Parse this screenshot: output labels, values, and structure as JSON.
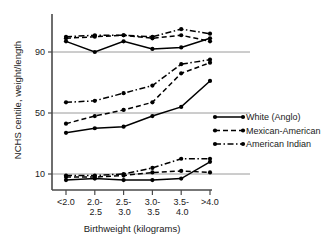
{
  "chart_data": {
    "type": "line",
    "title": "",
    "xlabel": "Birthweight  (kilograms)",
    "ylabel": "NCHS centile, weight/length",
    "categories": [
      "<2.0",
      "2.0-\n2.5",
      "2.5-\n3.0",
      "3.0-\n3.5",
      "3.5-\n4.0",
      ">4.0"
    ],
    "category_lines": [
      [
        "<2.0",
        ""
      ],
      [
        "2.0-",
        "2.5"
      ],
      [
        "2.5-",
        "3.0"
      ],
      [
        "3.0-",
        "3.5"
      ],
      [
        "3.5-",
        "4.0"
      ],
      [
        ">4.0",
        ""
      ]
    ],
    "yticks": [
      90,
      50,
      10
    ],
    "ytick_labels": [
      "90",
      "50",
      "10"
    ],
    "ylim": [
      3,
      112
    ],
    "grid": "horizontal",
    "legend_position": "right",
    "series": [
      {
        "name": "White (Anglo)",
        "linestyle": "solid",
        "marker": "filled-circle",
        "color": "#000000",
        "bands": [
          {
            "band": "90th",
            "values": [
              97,
              90,
              97,
              92,
              93,
              99
            ]
          },
          {
            "band": "50th",
            "values": [
              37,
              40,
              41,
              48,
              54,
              71
            ]
          },
          {
            "band": "10th",
            "values": [
              6,
              7,
              6,
              6,
              7,
              18
            ]
          }
        ]
      },
      {
        "name": "Mexican-American",
        "linestyle": "dashed",
        "marker": "filled-circle",
        "color": "#000000",
        "bands": [
          {
            "band": "90th",
            "values": [
              99,
              100,
              101,
              99,
              101,
              97
            ]
          },
          {
            "band": "50th",
            "values": [
              43,
              48,
              52,
              57,
              76,
              83
            ]
          },
          {
            "band": "10th",
            "values": [
              8,
              8,
              9,
              11,
              12,
              11
            ]
          }
        ]
      },
      {
        "name": "American Indian",
        "linestyle": "dash-dot",
        "marker": "filled-circle",
        "color": "#000000",
        "bands": [
          {
            "band": "90th",
            "values": [
              100,
              101,
              101,
              100,
              105,
              102
            ]
          },
          {
            "band": "50th",
            "values": [
              57,
              58,
              63,
              68,
              82,
              85
            ]
          },
          {
            "band": "10th",
            "values": [
              9,
              9,
              10,
              14,
              20,
              20
            ]
          }
        ]
      }
    ]
  },
  "legend": {
    "items": [
      {
        "label": "White (Anglo)",
        "style": "solid"
      },
      {
        "label": "Mexican-American",
        "style": "dashed"
      },
      {
        "label": "American Indian",
        "style": "dash-dot"
      }
    ]
  }
}
